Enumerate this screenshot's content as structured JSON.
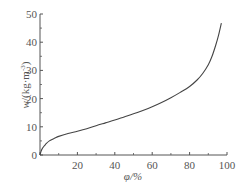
{
  "chart_data": {
    "type": "line",
    "title": "",
    "xlabel": "φ/%",
    "ylabel": "w/(kg·m⁻³)",
    "ylabel_parts": {
      "var": "w",
      "unit_open": "/(kg·m",
      "sup": "-3",
      "unit_close": ")"
    },
    "xlim": [
      0,
      100
    ],
    "ylim": [
      0,
      50
    ],
    "xticks": [
      0,
      20,
      40,
      60,
      80,
      100
    ],
    "xtick_labels": [
      "",
      "20",
      "40",
      "60",
      "80",
      "100"
    ],
    "xminor_ticks": [
      10,
      30,
      50,
      70,
      90
    ],
    "yticks": [
      0,
      10,
      20,
      30,
      40,
      50
    ],
    "ytick_labels": [
      "0",
      "10",
      "20",
      "30",
      "40",
      "50"
    ],
    "yminor_ticks": [
      5,
      15,
      25,
      35,
      45
    ],
    "origin_label": "0",
    "grid": false,
    "legend": null,
    "series": [
      {
        "name": "sorption isotherm",
        "color": "#444444",
        "x": [
          0,
          0.5,
          1,
          2,
          3,
          5,
          8,
          10,
          15,
          20,
          25,
          30,
          35,
          40,
          45,
          50,
          55,
          60,
          65,
          70,
          75,
          80,
          84,
          87,
          90,
          92,
          94,
          95.5,
          97
        ],
        "y": [
          0,
          1.2,
          2.0,
          3.0,
          3.8,
          5.0,
          6.0,
          6.6,
          7.6,
          8.4,
          9.3,
          10.4,
          11.4,
          12.4,
          13.5,
          14.6,
          15.8,
          17.1,
          18.6,
          20.3,
          22.2,
          24.3,
          26.6,
          28.9,
          32.0,
          35.0,
          39.0,
          42.5,
          46.8
        ]
      }
    ]
  }
}
